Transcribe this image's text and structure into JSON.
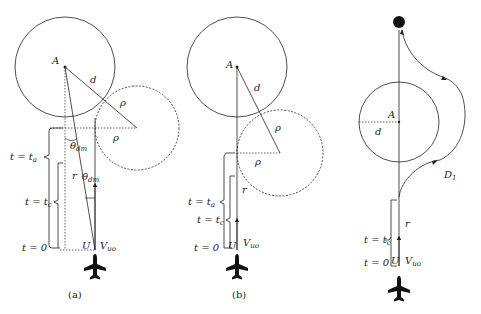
{
  "colors": {
    "stroke": "#222222",
    "background": "#ffffff"
  },
  "panels": [
    {
      "id": "a",
      "caption": "(a)",
      "labels": {
        "center": "A",
        "d": "d",
        "rho1": "ρ",
        "rho2": "ρ",
        "r": "r",
        "U": "U",
        "V": "V",
        "V_sub": "uo",
        "theta1": "θ",
        "theta1_sub": "dm",
        "theta2": "θ",
        "theta2_sub": "dm",
        "t_a": "t = t",
        "t_a_sub": "a",
        "t_c": "t = t",
        "t_c_sub": "c",
        "t_0": "t = 0"
      }
    },
    {
      "id": "b",
      "caption": "(b)",
      "labels": {
        "center": "A",
        "d": "d",
        "rho1": "ρ",
        "rho2": "ρ",
        "r": "r",
        "U": "U",
        "V": "V",
        "V_sub": "uo",
        "t_a": "t = t",
        "t_a_sub": "a",
        "t_c": "t = t",
        "t_c_sub": "c",
        "t_0": "t = 0"
      }
    },
    {
      "id": "c",
      "caption": "",
      "labels": {
        "center": "A",
        "d": "d",
        "D": "D",
        "D_sub": "1",
        "r": "r",
        "U": "U",
        "V": "V",
        "V_sub": "uo",
        "t_c": "t = t",
        "t_c_sub": "c",
        "t_0": "t = 0"
      }
    }
  ],
  "icons": [
    "aircraft-icon",
    "goal-point-icon",
    "arrow-icon"
  ]
}
